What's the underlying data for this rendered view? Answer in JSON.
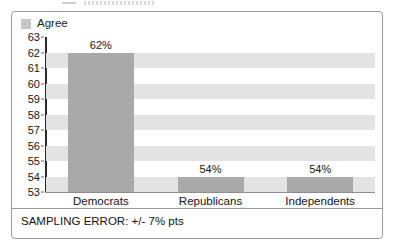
{
  "legend": {
    "swatch_color": "#c6c6c6",
    "label": "Agree",
    "position": "top-left"
  },
  "footer": {
    "note": "SAMPLING ERROR: +/- 7% pts"
  },
  "colors": {
    "bar_fill": "#a9a9a9",
    "band_fill": "#e3e3e3",
    "axis_line": "#2a2a2a",
    "border": "#9a9a9e",
    "text": "#141414"
  },
  "chart_data": {
    "type": "bar",
    "title": "",
    "subtitle": "",
    "xlabel": "",
    "ylabel": "",
    "categories": [
      "Democrats",
      "Republicans",
      "Independents"
    ],
    "values": [
      62,
      54,
      54
    ],
    "data_labels": [
      "62%",
      "54%",
      "54%"
    ],
    "series": [
      {
        "name": "Agree",
        "values": [
          62,
          54,
          54
        ]
      }
    ],
    "ylim": [
      53,
      63
    ],
    "ytick_labels": [
      "63",
      "62",
      "61",
      "60",
      "59",
      "58",
      "57",
      "56",
      "55",
      "54",
      "53"
    ],
    "yticks": [
      63,
      62,
      61,
      60,
      59,
      58,
      57,
      56,
      55,
      54,
      53
    ],
    "grid": "horizontal-alternating-bands",
    "legend_position": "top-left",
    "annotations": [
      "SAMPLING ERROR: +/- 7% pts"
    ]
  }
}
